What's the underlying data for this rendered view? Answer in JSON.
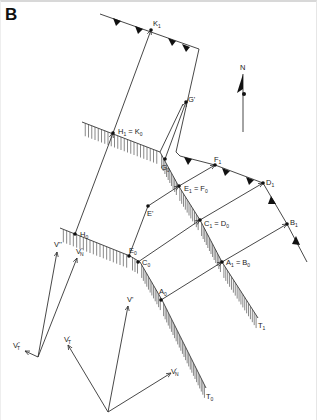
{
  "panel_label": "B",
  "north_label": "N",
  "colors": {
    "ink": "#333333",
    "background": "#ffffff"
  },
  "points": {
    "K1": {
      "base": "K",
      "sub": "1"
    },
    "H1_K0": {
      "text": "H",
      "sub1": "1",
      "eq": " = K",
      "sub2": "0"
    },
    "G_prime": {
      "text": "G'"
    },
    "G0": {
      "base": "G",
      "sub": "0"
    },
    "F1": {
      "base": "F",
      "sub": "1"
    },
    "E1_F0": {
      "text": "E",
      "sub1": "1",
      "eq": " = F",
      "sub2": "0"
    },
    "D1": {
      "base": "D",
      "sub": "1"
    },
    "E_prime": {
      "text": "E'"
    },
    "C1_D0": {
      "text": "C",
      "sub1": "1",
      "eq": " = D",
      "sub2": "0"
    },
    "B1": {
      "base": "B",
      "sub": "1"
    },
    "H0": {
      "base": "H",
      "sub": "0"
    },
    "E0": {
      "base": "E",
      "sub": "0"
    },
    "C0": {
      "base": "C",
      "sub": "0"
    },
    "A1_B0": {
      "text": "A",
      "sub1": "1",
      "eq": " = B",
      "sub2": "0"
    },
    "A0": {
      "base": "A",
      "sub": "0"
    },
    "T1": {
      "base": "T",
      "sub": "1"
    },
    "T0": {
      "base": "T",
      "sub": "0"
    }
  },
  "vectors": {
    "V_prime": "V'",
    "V_T_prime": {
      "base": "V",
      "sup": "'",
      "sub": "T"
    },
    "V_N_prime": {
      "base": "V",
      "sup": "'",
      "sub": "N"
    },
    "V_dprime": "V''",
    "V_N_dprime": {
      "base": "V",
      "sup": "''",
      "sub": "N"
    },
    "V_T_dprime": {
      "base": "V",
      "sup": "''",
      "sub": "T"
    }
  }
}
